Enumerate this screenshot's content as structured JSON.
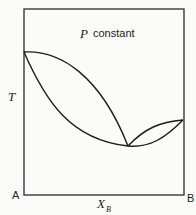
{
  "diagram": {
    "type": "phase-diagram",
    "title_var": "P",
    "title_text": "constant",
    "y_axis_label": "T",
    "x_axis_label_main": "X",
    "x_axis_label_sub": "B",
    "left_component": "A",
    "right_component": "B",
    "curves": [
      {
        "name": "upper-dome-curve",
        "description": "outer arc from pure A down to azeotrope"
      },
      {
        "name": "lower-u-curve",
        "description": "inner curve from pure A through azeotrope minimum to pure B"
      },
      {
        "name": "right-lens-upper",
        "description": "upper curve of lens between azeotrope and pure B"
      }
    ]
  }
}
